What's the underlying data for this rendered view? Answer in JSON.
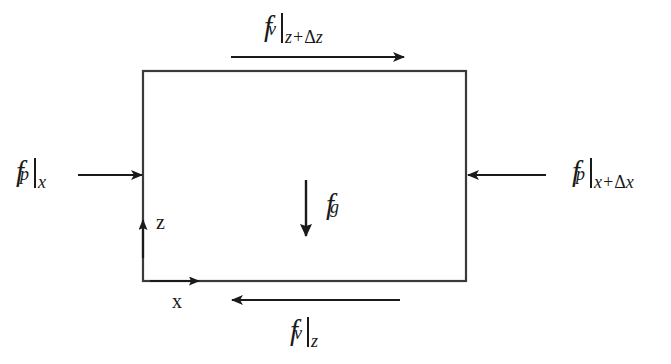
{
  "figure": {
    "type": "free-body-diagram",
    "title": "",
    "background_color": "#ffffff",
    "stroke_color": "#1a1a1a",
    "control_volume": {
      "name": "control-volume-box",
      "x": 143,
      "y": 71,
      "width": 323,
      "height": 210
    }
  },
  "forces": [
    {
      "id": "viscous-top",
      "symbol": "f",
      "subscript": "v",
      "evaluated_at_pre": "z+",
      "evaluated_at_delta": "Δ",
      "evaluated_at_post": "z",
      "label_plain": "f_v|_(z+Δz)",
      "arrow_direction": "right",
      "position": "above-top-edge"
    },
    {
      "id": "viscous-bottom",
      "symbol": "f",
      "subscript": "v",
      "evaluated_at_pre": "",
      "evaluated_at_delta": "",
      "evaluated_at_post": "z",
      "label_plain": "f_v|_z",
      "arrow_direction": "left",
      "position": "below-bottom-edge"
    },
    {
      "id": "pressure-left",
      "symbol": "f",
      "subscript": "p",
      "evaluated_at_pre": "",
      "evaluated_at_delta": "",
      "evaluated_at_post": "x",
      "label_plain": "f_p|_x",
      "arrow_direction": "right",
      "position": "left-of-box"
    },
    {
      "id": "pressure-right",
      "symbol": "f",
      "subscript": "p",
      "evaluated_at_pre": "x+",
      "evaluated_at_delta": "Δ",
      "evaluated_at_post": "x",
      "label_plain": "f_p|_(x+Δx)",
      "arrow_direction": "left",
      "position": "right-of-box"
    },
    {
      "id": "gravity",
      "symbol": "f",
      "subscript": "g",
      "evaluated_at_pre": "",
      "evaluated_at_delta": "",
      "evaluated_at_post": "",
      "label_plain": "f_g",
      "arrow_direction": "down",
      "position": "inside-box-center"
    }
  ],
  "axes": {
    "vertical": {
      "label": "z",
      "direction": "up"
    },
    "horizontal": {
      "label": "x",
      "direction": "right"
    }
  }
}
